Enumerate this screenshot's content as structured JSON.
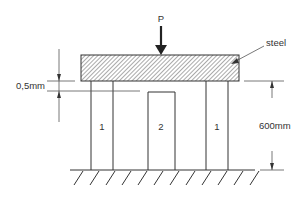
{
  "diagram": {
    "load": {
      "label": "P",
      "direction": "down"
    },
    "beam": {
      "label": "steel",
      "fill": "hatched"
    },
    "columns": [
      {
        "label": "1"
      },
      {
        "label": "2"
      },
      {
        "label": "1"
      }
    ],
    "dimensions": {
      "gap": "0,5mm",
      "height": "600mm"
    },
    "support": "fixed ground (hatched)",
    "colors": {
      "line": "#333333",
      "background": "#ffffff"
    }
  }
}
